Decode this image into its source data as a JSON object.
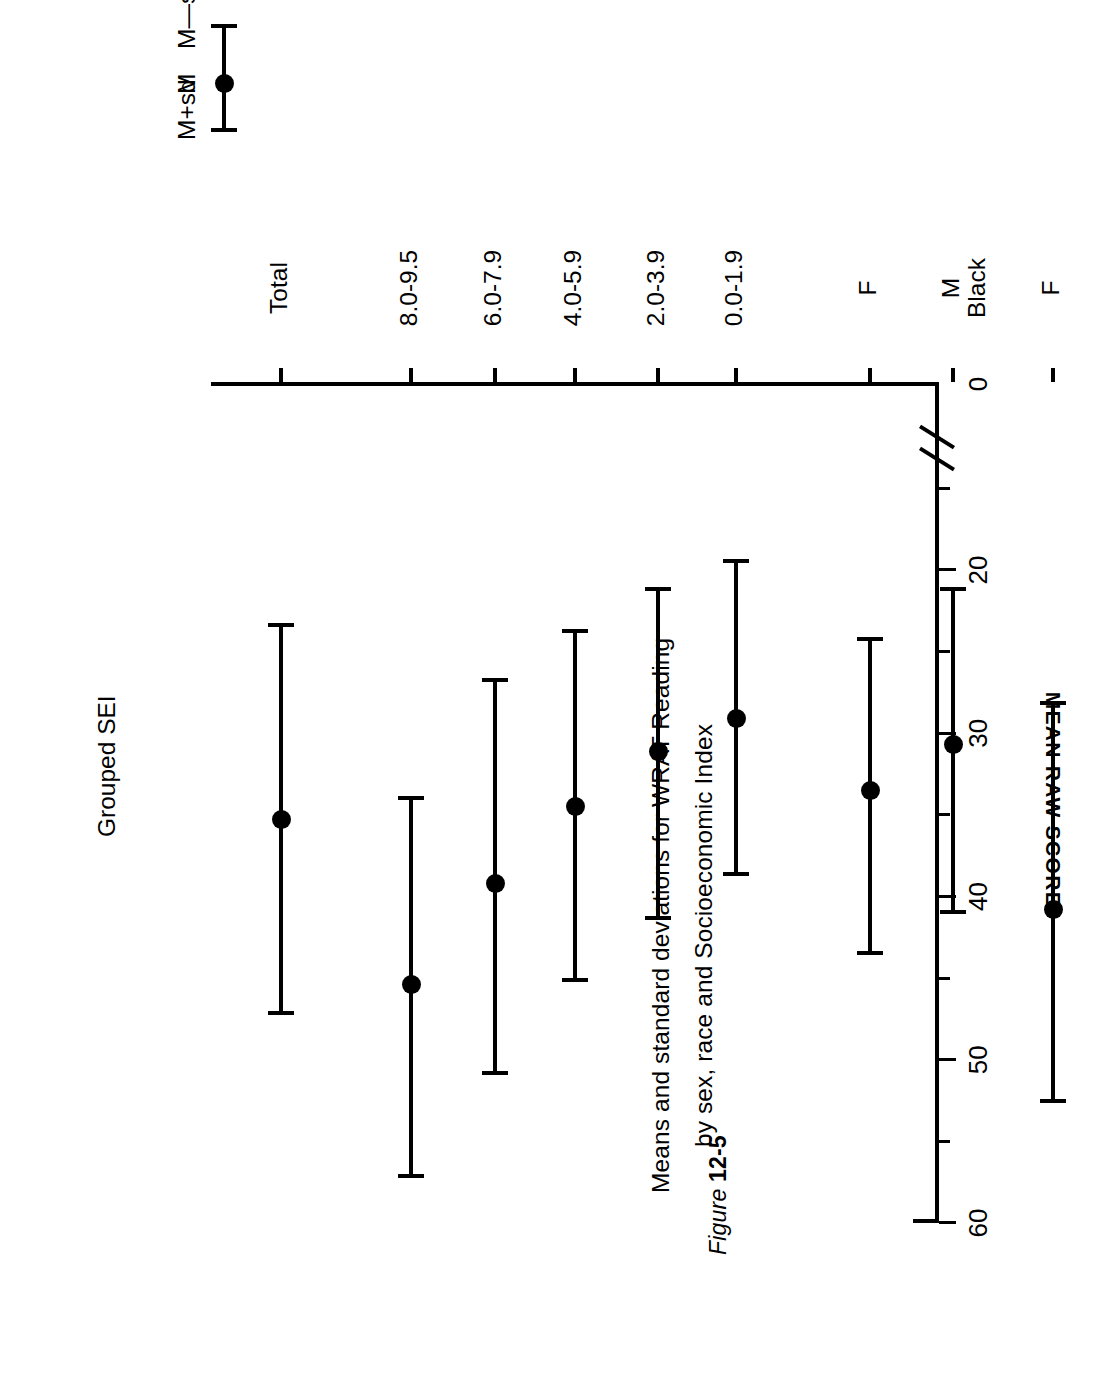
{
  "figure": {
    "number_prefix": "Figure",
    "number": "12-5",
    "title_line1": "Means and standard deviations for WRAT Reading",
    "title_line2": "by sex, race and Socioeconomic Index"
  },
  "legend": {
    "top_label": "M+sd",
    "mid_label": "M",
    "bottom_label": "M—sd"
  },
  "axes": {
    "y_title": "MEAN RAW SCORE",
    "x_title": "Grouped SEI",
    "y_tick_labels": [
      "60",
      "50",
      "40",
      "30",
      "20",
      "0"
    ],
    "group_labels": [
      "White",
      "Black"
    ]
  },
  "chart_data": {
    "type": "scatter",
    "title": "Means and standard deviations for WRAT Reading by sex, race and Socioeconomic Index",
    "subtitle": "Figure 12-5",
    "orientation": "horizontal",
    "xlabel": "Grouped SEI",
    "ylabel": "MEAN RAW SCORE",
    "ylim": [
      0,
      60
    ],
    "yticks": [
      0,
      20,
      30,
      40,
      50,
      60
    ],
    "y_minor_ticks": [
      15,
      25,
      35,
      45,
      55
    ],
    "axis_break": true,
    "axis_break_between": [
      0,
      15
    ],
    "grid": false,
    "legend_position": "top-right",
    "legend_entries": [
      "M+sd",
      "M",
      "M—sd"
    ],
    "categories": [
      "White M",
      "White F",
      "Black M",
      "Black F",
      "0.0-1.9",
      "2.0-3.9",
      "4.0-5.9",
      "6.0-7.9",
      "8.0-9.5",
      "Total"
    ],
    "category_short_labels": [
      "M",
      "F",
      "M",
      "F",
      "0.0-1.9",
      "2.0-3.9",
      "4.0-5.9",
      "6.0-7.9",
      "8.0-9.5",
      "Total"
    ],
    "series": [
      {
        "name": "M-sd",
        "values": [
          24.0,
          28.2,
          21.2,
          24.3,
          19.5,
          21.2,
          23.8,
          26.8,
          34.0,
          23.4
        ]
      },
      {
        "name": "M",
        "values": [
          37.9,
          40.8,
          30.7,
          33.5,
          29.1,
          31.1,
          34.5,
          39.2,
          45.4,
          35.3
        ]
      },
      {
        "name": "M+sd",
        "values": [
          50.3,
          52.6,
          41.0,
          43.5,
          38.7,
          41.4,
          45.2,
          50.9,
          57.2,
          47.2
        ]
      }
    ],
    "points": [
      {
        "label": "M",
        "group": "White",
        "low": 24.0,
        "mean": 37.9,
        "high": 50.3
      },
      {
        "label": "F",
        "group": "White",
        "low": 28.2,
        "mean": 40.8,
        "high": 52.6
      },
      {
        "label": "M",
        "group": "Black",
        "low": 21.2,
        "mean": 30.7,
        "high": 41.0
      },
      {
        "label": "F",
        "group": "Black",
        "low": 24.3,
        "mean": 33.5,
        "high": 43.5
      },
      {
        "label": "0.0-1.9",
        "group": "SEI",
        "low": 19.5,
        "mean": 29.1,
        "high": 38.7
      },
      {
        "label": "2.0-3.9",
        "group": "SEI",
        "low": 21.2,
        "mean": 31.1,
        "high": 41.4
      },
      {
        "label": "4.0-5.9",
        "group": "SEI",
        "low": 23.8,
        "mean": 34.5,
        "high": 45.2
      },
      {
        "label": "6.0-7.9",
        "group": "SEI",
        "low": 26.8,
        "mean": 39.2,
        "high": 50.9
      },
      {
        "label": "8.0-9.5",
        "group": "SEI",
        "low": 34.0,
        "mean": 45.4,
        "high": 57.2
      },
      {
        "label": "Total",
        "group": "Total",
        "low": 23.4,
        "mean": 35.3,
        "high": 47.2
      }
    ]
  }
}
